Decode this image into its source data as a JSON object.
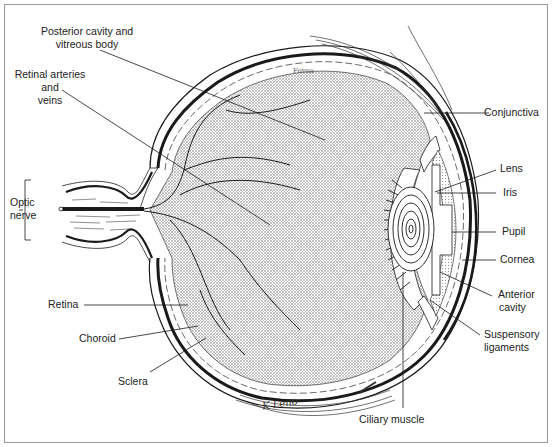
{
  "diagram": {
    "signature": "K Leno",
    "fovea_label": "Fovea",
    "labels": {
      "posterior_cavity": [
        "Posterior cavity and",
        "vitreous body"
      ],
      "retinal_vessels": [
        "Retinal arteries",
        "and",
        "veins"
      ],
      "optic_nerve": [
        "Optic",
        "nerve"
      ],
      "retina": "Retina",
      "choroid": "Choroid",
      "sclera": "Sclera",
      "ciliary_muscle": "Ciliary muscle",
      "conjunctiva": "Conjunctiva",
      "lens": "Lens",
      "iris": "Iris",
      "pupil": "Pupil",
      "cornea": "Cornea",
      "anterior_cavity": [
        "Anterior",
        "cavity"
      ],
      "suspensory_ligaments": [
        "Suspensory",
        "ligaments"
      ]
    },
    "colors": {
      "line": "#1a1a1a",
      "stipple": "#8a8a8a",
      "frame": "#9a9a9a"
    }
  }
}
